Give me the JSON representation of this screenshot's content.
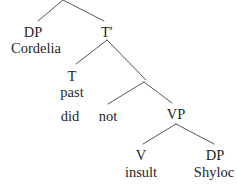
{
  "diagram": {
    "type": "syntax-tree",
    "sentence": "Cordelia did not insult Shylock",
    "line_color": "#555555",
    "text_color": "#1f1f1f",
    "background_color": "#ffffff",
    "cropped_note": "top apex and rightmost word are cut off by the image frame"
  },
  "nodes": [
    {
      "id": "dp-subject",
      "label": "DP",
      "kind": "category",
      "x": 33,
      "y": 25
    },
    {
      "id": "t-bar",
      "label": "T′",
      "kind": "category",
      "x": 107,
      "y": 25
    },
    {
      "id": "cordelia",
      "label": "Cordelia",
      "kind": "word",
      "x": 36,
      "y": 41
    },
    {
      "id": "t-head",
      "label": "T",
      "kind": "category",
      "x": 72,
      "y": 69
    },
    {
      "id": "past",
      "label": "past",
      "kind": "word",
      "x": 72,
      "y": 85
    },
    {
      "id": "did",
      "label": "did",
      "kind": "word",
      "x": 70,
      "y": 109
    },
    {
      "id": "not",
      "label": "not",
      "kind": "word",
      "x": 108,
      "y": 109
    },
    {
      "id": "vp",
      "label": "VP",
      "kind": "category",
      "x": 176,
      "y": 107
    },
    {
      "id": "v-head",
      "label": "V",
      "kind": "category",
      "x": 141,
      "y": 148
    },
    {
      "id": "dp-object",
      "label": "DP",
      "kind": "category",
      "x": 215,
      "y": 148
    },
    {
      "id": "insult",
      "label": "insult",
      "kind": "word",
      "x": 141,
      "y": 165
    },
    {
      "id": "shylock",
      "label": "Shyloc",
      "kind": "word",
      "x": 214,
      "y": 165
    }
  ],
  "branches": [
    {
      "id": "root-to-dp",
      "from": [
        63,
        0
      ],
      "to": [
        38,
        21
      ]
    },
    {
      "id": "root-to-tbar",
      "from": [
        63,
        0
      ],
      "to": [
        104,
        21
      ]
    },
    {
      "id": "tbar-to-t",
      "from": [
        107,
        40
      ],
      "to": [
        76,
        64
      ]
    },
    {
      "id": "tbar-to-negp",
      "from": [
        107,
        40
      ],
      "to": [
        146,
        80
      ]
    },
    {
      "id": "negp-to-not",
      "from": [
        144,
        82
      ],
      "to": [
        108,
        104
      ]
    },
    {
      "id": "negp-to-vp",
      "from": [
        144,
        82
      ],
      "to": [
        172,
        103
      ]
    },
    {
      "id": "vp-to-v",
      "from": [
        176,
        124
      ],
      "to": [
        143,
        144
      ]
    },
    {
      "id": "vp-to-dp",
      "from": [
        176,
        124
      ],
      "to": [
        214,
        144
      ]
    }
  ]
}
